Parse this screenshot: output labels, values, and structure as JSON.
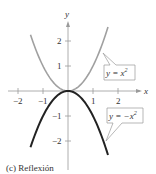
{
  "chart_data": {
    "type": "line",
    "title": "",
    "caption": "(c)  Reflexión",
    "xlabel": "x",
    "ylabel": "y",
    "xlim": [
      -2.5,
      2.8
    ],
    "ylim": [
      -2.9,
      2.7
    ],
    "x_ticks": [
      "−2",
      "−1",
      "1",
      "2"
    ],
    "y_ticks": [
      "2",
      "1",
      "−1",
      "−2"
    ],
    "grid": false,
    "series": [
      {
        "name": "y = x^2",
        "label": "y = x",
        "exp": "2",
        "color": "#a0a0a0",
        "formula": "x^2",
        "x_range": [
          -1.5,
          1.6
        ]
      },
      {
        "name": "y = -x^2",
        "label": "y = −x",
        "exp": "2",
        "color": "#222222",
        "formula": "-x^2",
        "x_range": [
          -1.5,
          1.6
        ]
      }
    ],
    "annotations": [
      {
        "text": "y = x^2",
        "target_series": 0
      },
      {
        "text": "y = -x^2",
        "target_series": 1
      }
    ]
  },
  "labels": {
    "x_axis": "x",
    "y_axis": "y",
    "xt_m2": "−2",
    "xt_m1": "−1",
    "xt_1": "1",
    "xt_2": "2",
    "yt_2": "2",
    "yt_1": "1",
    "yt_m1": "−1",
    "yt_m2": "−2",
    "callout1": "y = x",
    "callout1_exp": "2",
    "callout2": "y = −x",
    "callout2_exp": "2",
    "caption": "(c)  Reflexión"
  }
}
